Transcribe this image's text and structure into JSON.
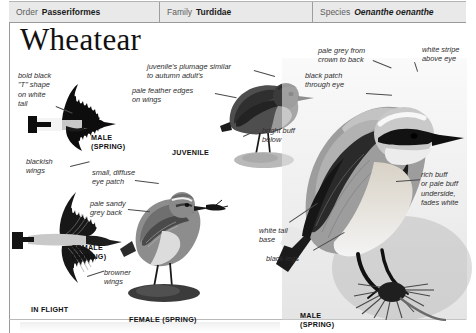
{
  "taxonomy": [
    {
      "key": "Order",
      "value": "Passeriformes",
      "italic": false
    },
    {
      "key": "Family",
      "value": "Turdidae",
      "italic": false
    },
    {
      "key": "Species",
      "value": "Oenanthe oenanthe",
      "italic": true
    }
  ],
  "title": "Wheatear",
  "annotations": {
    "tail_t_shape": "bold black\n\"T\" shape\non white\ntail",
    "blackish_wings": "blackish\nwings",
    "juvenile_plumage": "juvenile's plumage similar\nto autumn adult's",
    "pale_feather_edges": "pale feather edges\non wings",
    "bright_buff_below": "bright buff\nbelow",
    "small_diffuse_eye_patch": "small, diffuse\neye patch",
    "pale_sandy_grey_back": "pale sandy\ngrey back",
    "browner_wings": "browner\nwings",
    "white_tail_base": "white tail\nbase",
    "black_legs": "black legs",
    "pale_grey_crown": "pale grey from\ncrown to back",
    "white_stripe_above_eye": "white stripe\nabove eye",
    "black_patch_through_eye": "black patch\nthrough eye",
    "rich_buff_underside": "rich buff\nor pale buff\nunderside,\nfades white"
  },
  "captions": {
    "male_spring_flight_top": "MALE\n(SPRING)",
    "juvenile": "JUVENILE",
    "female_spring_flight": "FEMALE\n(SPRING)",
    "in_flight": "IN FLIGHT",
    "female_spring_perched": "FEMALE (SPRING)",
    "male_spring_perched": "MALE\n(SPRING)"
  },
  "colors": {
    "header_bg": "#e9e9e9",
    "rule": "#9a9a9a",
    "ink": "#111111",
    "anno_ink": "#2e2e2e"
  }
}
